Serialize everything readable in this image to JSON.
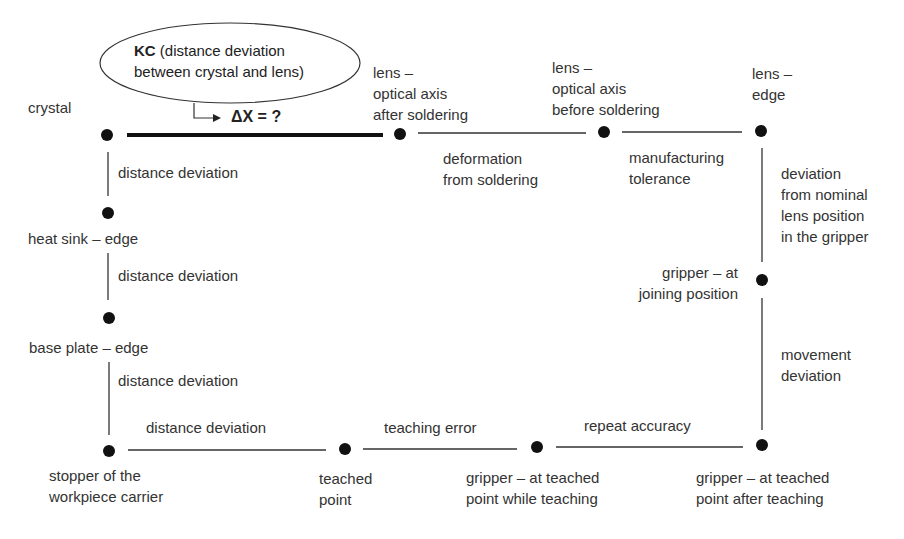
{
  "callout": {
    "kc_bold": "KC",
    "kc_line1_rest": " (distance deviation",
    "kc_line2": "between crystal and lens)",
    "delta": "ΔX = ?"
  },
  "nodes": {
    "crystal": "crystal",
    "lens_after": "lens –\noptical axis\nafter soldering",
    "lens_before": "lens –\noptical axis\nbefore soldering",
    "lens_edge": "lens –\nedge",
    "heat_sink": "heat sink – edge",
    "base_plate": "base plate – edge",
    "gripper_joining": "gripper – at\njoining position",
    "stopper": "stopper of the\nworkpiece carrier",
    "teached_point": "teached\npoint",
    "gripper_while": "gripper – at teached\npoint while teaching",
    "gripper_after": "gripper – at teached\npoint after teaching"
  },
  "edges": {
    "deformation": "deformation\nfrom soldering",
    "manufacturing": "manufacturing\ntolerance",
    "dist_dev_1": "distance deviation",
    "dist_dev_2": "distance deviation",
    "dist_dev_3": "distance deviation",
    "deviation_gripper": "deviation\nfrom nominal\nlens position\nin the gripper",
    "movement": "movement\ndeviation",
    "dist_dev_bottom": "distance deviation",
    "teaching_error": "teaching error",
    "repeat_accuracy": "repeat accuracy"
  }
}
